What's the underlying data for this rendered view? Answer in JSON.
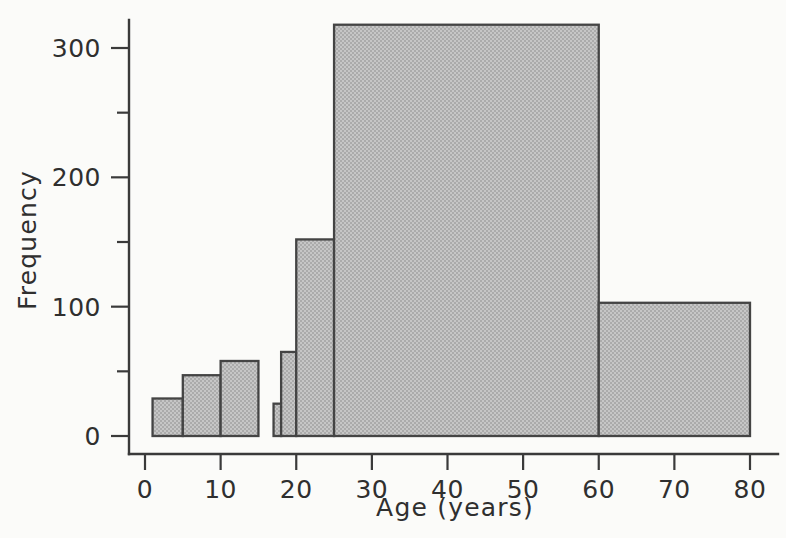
{
  "chart_data": {
    "type": "bar",
    "title": "",
    "subtitle": "",
    "xlabel": "Age (years)",
    "ylabel": "Frequency",
    "xlim": [
      0,
      80
    ],
    "ylim": [
      0,
      320
    ],
    "grid": false,
    "legend": null,
    "style": {
      "bar_fill": "#b9b9b9",
      "bar_edge": "#444444",
      "axis_color": "#3a3a3a",
      "background": "#fbfbf9",
      "text_color": "#2f2f2f"
    },
    "x_ticks": [
      {
        "value": 0,
        "label": "0"
      },
      {
        "value": 10,
        "label": "10"
      },
      {
        "value": 20,
        "label": "20"
      },
      {
        "value": 30,
        "label": "30"
      },
      {
        "value": 40,
        "label": "40"
      },
      {
        "value": 50,
        "label": "50"
      },
      {
        "value": 60,
        "label": "60"
      },
      {
        "value": 70,
        "label": "70"
      },
      {
        "value": 80,
        "label": "80"
      }
    ],
    "y_ticks": [
      {
        "value": 0,
        "label": "0",
        "major": true
      },
      {
        "value": 50,
        "label": "",
        "major": false
      },
      {
        "value": 100,
        "label": "100",
        "major": true
      },
      {
        "value": 150,
        "label": "",
        "major": false
      },
      {
        "value": 200,
        "label": "200",
        "major": true
      },
      {
        "value": 250,
        "label": "",
        "major": false
      },
      {
        "value": 300,
        "label": "300",
        "major": true
      }
    ],
    "bins": [
      {
        "x0": 1,
        "x1": 5,
        "value": 29
      },
      {
        "x0": 5,
        "x1": 10,
        "value": 47
      },
      {
        "x0": 10,
        "x1": 15,
        "value": 58
      },
      {
        "x0": 17,
        "x1": 18,
        "value": 25
      },
      {
        "x0": 18,
        "x1": 20,
        "value": 65
      },
      {
        "x0": 20,
        "x1": 25,
        "value": 152
      },
      {
        "x0": 25,
        "x1": 60,
        "value": 318
      },
      {
        "x0": 60,
        "x1": 80,
        "value": 103
      }
    ],
    "categories": [
      "1-5",
      "5-10",
      "10-15",
      "17-18",
      "18-20",
      "20-25",
      "25-60",
      "60-80"
    ],
    "values": [
      29,
      47,
      58,
      25,
      65,
      152,
      318,
      103
    ]
  }
}
